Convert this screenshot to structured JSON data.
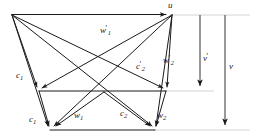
{
  "figure": {
    "background_color": "#ffffff",
    "stroke_color": "#1a1a1a",
    "guide_color": "#c9c9c9"
  },
  "labels": {
    "u": {
      "text": "u",
      "sub": "",
      "prime": false,
      "x": 168,
      "y": 2,
      "name": "label-u"
    },
    "w1_prime": {
      "text": "w",
      "sub": "1",
      "prime": true,
      "x": 100,
      "y": 28,
      "name": "label-w1-prime"
    },
    "c2_prime": {
      "text": "c",
      "sub": "2",
      "prime": true,
      "x": 137,
      "y": 64,
      "name": "label-c2-prime"
    },
    "w2_prime": {
      "text": "w",
      "sub": "2",
      "prime": true,
      "x": 163,
      "y": 58,
      "name": "label-w2-prime"
    },
    "c1_mid": {
      "text": "c",
      "sub": "1",
      "prime": false,
      "x": 17,
      "y": 73,
      "name": "label-c1-mid"
    },
    "c1_bot": {
      "text": "c",
      "sub": "1",
      "prime": false,
      "x": 30,
      "y": 117,
      "name": "label-c1-bottom"
    },
    "w1": {
      "text": "w",
      "sub": "1",
      "prime": false,
      "x": 74,
      "y": 113,
      "name": "label-w1"
    },
    "c2": {
      "text": "c",
      "sub": "2",
      "prime": false,
      "x": 120,
      "y": 111,
      "name": "label-c2"
    },
    "w2": {
      "text": "w",
      "sub": "2",
      "prime": false,
      "x": 156,
      "y": 113,
      "name": "label-w2"
    },
    "v_prime": {
      "text": "v",
      "sub": "",
      "prime": true,
      "x": 203,
      "y": 55,
      "name": "label-v-prime"
    },
    "v": {
      "text": "v",
      "sub": "",
      "prime": false,
      "x": 229,
      "y": 63,
      "name": "label-v"
    }
  },
  "geometry": {
    "apex_left": {
      "x": 12,
      "y": 15
    },
    "apex_right": {
      "x": 172,
      "y": 15
    },
    "mid_left": {
      "x": 39,
      "y": 91
    },
    "mid_right": {
      "x": 166,
      "y": 91
    },
    "bottom_left": {
      "x": 50,
      "y": 130
    },
    "bottom_right": {
      "x": 155,
      "y": 130
    },
    "v_prime_arrow": {
      "x": 200,
      "y_top": 15,
      "y_bottom": 91
    },
    "v_arrow": {
      "x": 225,
      "y_top": 15,
      "y_bottom": 130
    },
    "guide_top": {
      "y": 15,
      "x_start": 172,
      "x_end": 250
    },
    "guide_mid": {
      "y": 91,
      "x_start": 166,
      "x_end": 215
    },
    "guide_bottom": {
      "y": 130,
      "x_start": 155,
      "x_end": 250
    }
  }
}
